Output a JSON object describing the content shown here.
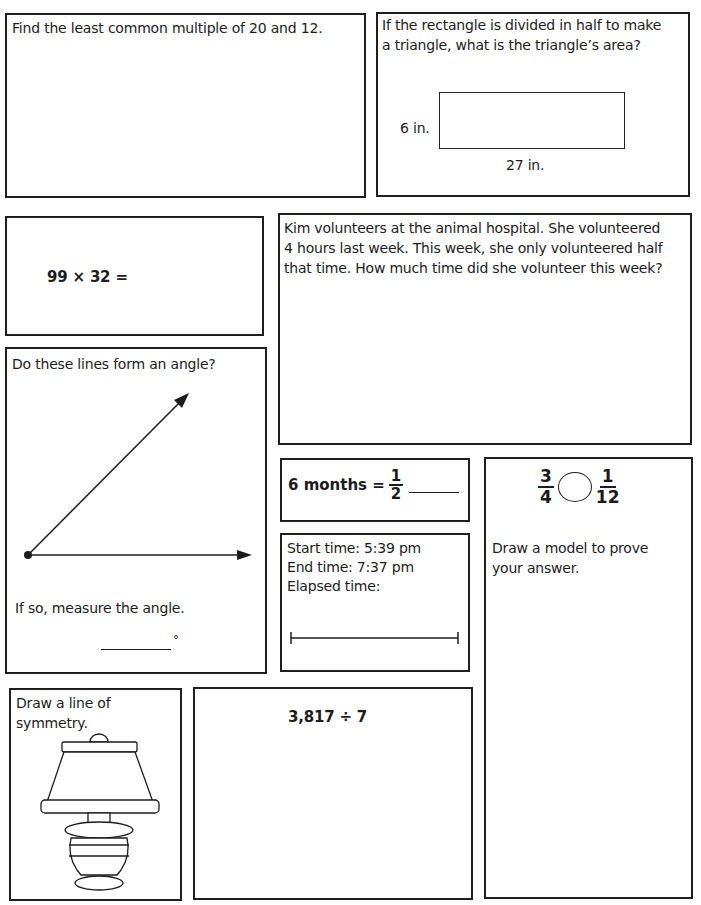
{
  "worksheet": {
    "lcm": {
      "prompt": "Find the least common multiple of 20 and 12."
    },
    "triangle": {
      "prompt_line1": "If the rectangle is divided in half to make",
      "prompt_line2": "a triangle, what is the triangle’s area?",
      "height_label": "6 in.",
      "width_label": "27 in."
    },
    "multiply": {
      "expression": "99 × 32 ="
    },
    "volunteer": {
      "line1": "Kim volunteers at the animal hospital. She volunteered",
      "line2": "4 hours last week. This week, she only volunteered half",
      "line3": "that time. How much time did she volunteer this week?"
    },
    "angle": {
      "prompt": "Do these lines form an angle?",
      "follow_up": "If so, measure the angle.",
      "degree_symbol": "°"
    },
    "months": {
      "left": "6 months =",
      "numerator": "1",
      "denominator": "2"
    },
    "elapsed": {
      "start": "Start time: 5:39 pm",
      "end": "End time: 7:37 pm",
      "label": "Elapsed time:"
    },
    "compare": {
      "left_numerator": "3",
      "left_denominator": "4",
      "right_numerator": "1",
      "right_denominator": "12",
      "prompt_line1": "Draw a model to prove",
      "prompt_line2": "your answer."
    },
    "symmetry": {
      "prompt_line1": "Draw a line of",
      "prompt_line2": "symmetry."
    },
    "division": {
      "expression": "3,817 ÷ 7"
    }
  }
}
